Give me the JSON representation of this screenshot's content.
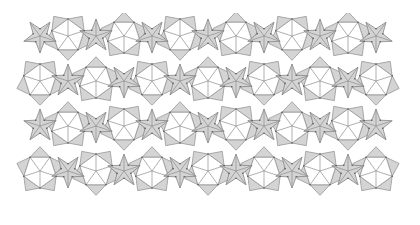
{
  "figure": {
    "name": "quasiperiodic-star-pentagon-tiling",
    "title": "",
    "caption": "",
    "background_color": "#ffffff",
    "canvas": {
      "width": 420,
      "height": 225
    }
  },
  "style": {
    "star_fill": "#d4d4d4",
    "star_stroke": "#7a7a7a",
    "pentagon_fill": "#ffffff",
    "pentagon_stroke": "#8c8c8c",
    "triangle_fill": "#d4d4d4",
    "triangle_stroke": "#8c8c8c",
    "line_color": "#8c8c8c",
    "line_width": 0.7,
    "vertex_color": "#555555",
    "vertex_radius": 0.8
  },
  "pattern": {
    "type": "quasiperiodic-tiling",
    "symmetry": "5-fold",
    "description": "Decagonal quasiperiodic tiling of five-pointed stars, regular pentagons and triangles with internal spoke subdivision.",
    "clip": {
      "x": 12,
      "y": 13,
      "width": 388,
      "height": 196
    },
    "lattice": {
      "columns": 7,
      "rows": 5,
      "cell_width": 56,
      "cell_height": 45,
      "origin_x": 12,
      "origin_y": 13,
      "row_offset": 28
    },
    "star_radius_outer": 17,
    "star_radius_inner": 7.2,
    "pentagon_radius": 17,
    "star_count": 21,
    "pentagon_count": 28,
    "triangle_count": 84
  },
  "chart_data": {
    "type": "scatter",
    "xlabel": "",
    "ylabel": "",
    "xlim": [
      0,
      420
    ],
    "ylim": [
      0,
      225
    ],
    "grid": false,
    "legend": [],
    "series": [
      {
        "name": "stars",
        "fill": "#d4d4d4",
        "points": [
          [
            40,
            36
          ],
          [
            96,
            36
          ],
          [
            152,
            36
          ],
          [
            208,
            36
          ],
          [
            264,
            36
          ],
          [
            320,
            36
          ],
          [
            376,
            36
          ],
          [
            68,
            81
          ],
          [
            124,
            81
          ],
          [
            180,
            81
          ],
          [
            236,
            81
          ],
          [
            292,
            81
          ],
          [
            348,
            81
          ],
          [
            40,
            126
          ],
          [
            96,
            126
          ],
          [
            152,
            126
          ],
          [
            208,
            126
          ],
          [
            264,
            126
          ],
          [
            320,
            126
          ],
          [
            376,
            126
          ],
          [
            68,
            171
          ],
          [
            124,
            171
          ],
          [
            180,
            171
          ],
          [
            236,
            171
          ],
          [
            292,
            171
          ],
          [
            348,
            171
          ]
        ]
      },
      {
        "name": "pentagons",
        "fill": "#ffffff",
        "points": [
          [
            68,
            36
          ],
          [
            124,
            36
          ],
          [
            180,
            36
          ],
          [
            236,
            36
          ],
          [
            292,
            36
          ],
          [
            348,
            36
          ],
          [
            40,
            81
          ],
          [
            96,
            81
          ],
          [
            152,
            81
          ],
          [
            208,
            81
          ],
          [
            264,
            81
          ],
          [
            320,
            81
          ],
          [
            376,
            81
          ],
          [
            68,
            126
          ],
          [
            124,
            126
          ],
          [
            180,
            126
          ],
          [
            236,
            126
          ],
          [
            292,
            126
          ],
          [
            348,
            126
          ],
          [
            40,
            171
          ],
          [
            96,
            171
          ],
          [
            152,
            171
          ],
          [
            208,
            171
          ],
          [
            264,
            171
          ],
          [
            320,
            171
          ],
          [
            376,
            171
          ]
        ]
      }
    ]
  }
}
